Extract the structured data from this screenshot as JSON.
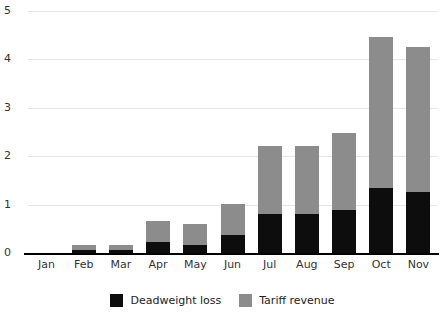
{
  "chart_data": {
    "type": "bar",
    "subtype": "stacked-vertical",
    "title": "",
    "subtitle": "",
    "xlabel": "",
    "ylabel": "",
    "categories": [
      "Jan",
      "Feb",
      "Mar",
      "Apr",
      "May",
      "Jun",
      "Jul",
      "Aug",
      "Sep",
      "Oct",
      "Nov"
    ],
    "series": [
      {
        "name": "Deadweight loss",
        "color": "#0d0d0d",
        "values": [
          0,
          0.06,
          0.06,
          0.22,
          0.17,
          0.37,
          0.8,
          0.8,
          0.88,
          1.35,
          1.26
        ]
      },
      {
        "name": "Tariff revenue",
        "color": "#8c8c8c",
        "values": [
          0,
          0.1,
          0.1,
          0.45,
          0.42,
          0.65,
          1.42,
          1.42,
          1.6,
          3.12,
          3.0
        ]
      }
    ],
    "totals": [
      0,
      0.16,
      0.16,
      0.67,
      0.59,
      1.02,
      2.22,
      2.22,
      2.48,
      4.47,
      4.26
    ],
    "ylim": [
      0,
      5
    ],
    "yticks": [
      0,
      1,
      2,
      3,
      4,
      5
    ],
    "ytick_labels": [
      "0",
      "1",
      "2",
      "3",
      "4",
      "5"
    ],
    "grid": true,
    "grid_axis": "y",
    "legend_position": "bottom-center",
    "legend": [
      "Deadweight loss",
      "Tariff revenue"
    ]
  },
  "legend": {
    "entries": [
      {
        "label": "Deadweight loss",
        "color": "#0d0d0d",
        "swatch_name": "legend-swatch-deadweight-loss"
      },
      {
        "label": "Tariff revenue",
        "color": "#8c8c8c",
        "swatch_name": "legend-swatch-tariff-revenue"
      }
    ]
  },
  "colors": {
    "deadweight": "#0d0d0d",
    "tariff": "#8c8c8c",
    "grid": "#e6e6e6",
    "axis": "#000000",
    "text": "#333333",
    "background": "#ffffff"
  }
}
